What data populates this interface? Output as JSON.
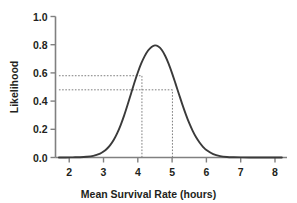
{
  "chart_data": {
    "type": "line",
    "title": "",
    "subtitle": "",
    "xlabel": "Mean Survival Rate (hours)",
    "ylabel": "Likelihood",
    "xlim": [
      1.6,
      8.35
    ],
    "ylim": [
      0.0,
      1.0
    ],
    "grid": false,
    "legend": false,
    "legend_position": "none",
    "xticks": [
      "2",
      "3",
      "4",
      "5",
      "6",
      "7",
      "8"
    ],
    "xtick_values": [
      2,
      3,
      4,
      5,
      6,
      7,
      8
    ],
    "yticks": [
      "0.0",
      "0.2",
      "0.4",
      "0.6",
      "0.8",
      "1.0"
    ],
    "ytick_values": [
      0.0,
      0.2,
      0.4,
      0.6,
      0.8,
      1.0
    ],
    "series": [
      {
        "name": "Likelihood",
        "color": "#3a3a3a",
        "x": [
          1.7,
          1.9,
          2.1,
          2.3,
          2.5,
          2.7,
          2.9,
          3.0,
          3.1,
          3.2,
          3.3,
          3.4,
          3.5,
          3.6,
          3.7,
          3.8,
          3.9,
          4.0,
          4.1,
          4.2,
          4.3,
          4.4,
          4.5,
          4.6,
          4.7,
          4.8,
          4.9,
          5.0,
          5.1,
          5.2,
          5.3,
          5.4,
          5.5,
          5.6,
          5.7,
          5.8,
          5.9,
          6.0,
          6.2,
          6.4,
          6.6,
          6.8,
          7.0,
          7.4,
          7.8,
          8.2
        ],
        "y": [
          0.0,
          0.0,
          0.001,
          0.002,
          0.005,
          0.012,
          0.028,
          0.042,
          0.062,
          0.09,
          0.126,
          0.173,
          0.23,
          0.297,
          0.372,
          0.451,
          0.53,
          0.603,
          0.667,
          0.719,
          0.759,
          0.784,
          0.795,
          0.787,
          0.762,
          0.72,
          0.664,
          0.597,
          0.524,
          0.449,
          0.375,
          0.306,
          0.243,
          0.189,
          0.143,
          0.106,
          0.076,
          0.053,
          0.024,
          0.01,
          0.004,
          0.002,
          0.001,
          0.0,
          0.0,
          0.0
        ]
      }
    ],
    "annotations": [
      {
        "type": "hline",
        "label": "upper-likelihood-reference",
        "y": 0.58,
        "x_start": 1.7,
        "x_end": 4.12,
        "style": "dashed"
      },
      {
        "type": "hline",
        "label": "lower-likelihood-reference",
        "y": 0.48,
        "x_start": 1.7,
        "x_end": 5.01,
        "style": "dashed"
      },
      {
        "type": "vline",
        "label": "lower-bound-dropline",
        "x": 4.12,
        "y_start": 0.0,
        "y_end": 0.58,
        "style": "dashed"
      },
      {
        "type": "vline",
        "label": "upper-bound-dropline",
        "x": 5.01,
        "y_start": 0.0,
        "y_end": 0.48,
        "style": "dashed"
      }
    ],
    "colors": {
      "curve": "#3a3a3a",
      "axis": "#808080",
      "annotation": "#6e6e6e",
      "text": "#231f20",
      "background": "#ffffff"
    }
  }
}
